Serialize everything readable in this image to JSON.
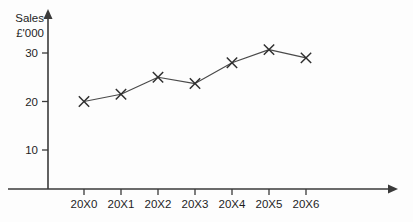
{
  "chart_data": {
    "type": "line",
    "title": "",
    "subtitle": "",
    "ylabel_line1": "Sales",
    "ylabel_line2": "£'000",
    "xlabel": "",
    "categories": [
      "20X0",
      "20X1",
      "20X2",
      "20X3",
      "20X4",
      "20X5",
      "20X6"
    ],
    "values": [
      20,
      21.5,
      25,
      23.7,
      28,
      30.7,
      29
    ],
    "series": [
      {
        "name": "Sales",
        "values": [
          20,
          21.5,
          25,
          23.7,
          28,
          30.7,
          29
        ]
      }
    ],
    "y_ticks": [
      10,
      20,
      30
    ],
    "y_tick_labels": [
      "10",
      "20",
      "30"
    ],
    "ylim": [
      0,
      33
    ],
    "xlim": [
      0,
      8
    ],
    "grid": false,
    "legend": false,
    "legend_position": "none",
    "marker": "x-cross",
    "annotations": []
  },
  "colors": {
    "background": "#fdfdfd",
    "axis": "#3a3a3a",
    "line": "#4a4a4a",
    "marker": "#2e2e2e",
    "text": "#1d1d1d"
  }
}
